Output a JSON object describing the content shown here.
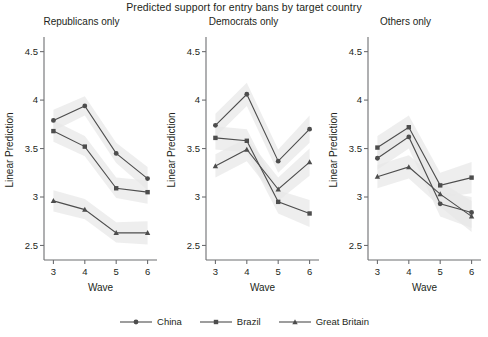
{
  "chart_data": {
    "type": "line",
    "title": "Predicted support for entry bans by target country",
    "xlabel": "Wave",
    "ylabel": "Linear Prediction",
    "x": [
      3,
      4,
      5,
      6
    ],
    "xticklabels": [
      "3",
      "4",
      "5",
      "6"
    ],
    "xlim": [
      2.7,
      6.3
    ],
    "ylim": [
      2.35,
      4.62
    ],
    "yticks": [
      2.5,
      3,
      3.5,
      4,
      4.5
    ],
    "yticklabels": [
      "2.5",
      "3",
      "3.5",
      "4",
      "4.5"
    ],
    "grid": false,
    "legend_position": "bottom",
    "legend_entries": [
      "China",
      "Brazil",
      "Great Britain"
    ],
    "markers": [
      "circle",
      "square",
      "triangle"
    ],
    "line_color": "#4d4d4d",
    "band_color": "#e8e8e8",
    "panels": [
      {
        "title": "Republicans only",
        "series": [
          {
            "name": "China",
            "marker": "circle",
            "values": [
              3.79,
              3.94,
              3.45,
              3.19
            ],
            "ci_lower": [
              3.68,
              3.84,
              3.35,
              3.07
            ],
            "ci_upper": [
              3.9,
              4.04,
              3.56,
              3.31
            ]
          },
          {
            "name": "Brazil",
            "marker": "square",
            "values": [
              3.68,
              3.52,
              3.09,
              3.05
            ],
            "ci_lower": [
              3.57,
              3.42,
              2.99,
              2.93
            ],
            "ci_upper": [
              3.79,
              3.63,
              3.2,
              3.17
            ]
          },
          {
            "name": "Great Britain",
            "marker": "triangle",
            "values": [
              2.96,
              2.87,
              2.63,
              2.63
            ],
            "ci_lower": [
              2.85,
              2.77,
              2.53,
              2.51
            ],
            "ci_upper": [
              3.07,
              2.98,
              2.74,
              2.75
            ]
          }
        ]
      },
      {
        "title": "Democrats only",
        "series": [
          {
            "name": "China",
            "marker": "circle",
            "values": [
              3.74,
              4.06,
              3.37,
              3.7
            ],
            "ci_lower": [
              3.62,
              3.94,
              3.25,
              3.56
            ],
            "ci_upper": [
              3.86,
              4.18,
              3.49,
              3.84
            ]
          },
          {
            "name": "Brazil",
            "marker": "square",
            "values": [
              3.61,
              3.58,
              2.95,
              2.83
            ],
            "ci_lower": [
              3.49,
              3.46,
              2.83,
              2.69
            ],
            "ci_upper": [
              3.73,
              3.7,
              3.07,
              2.97
            ]
          },
          {
            "name": "Great Britain",
            "marker": "triangle",
            "values": [
              3.32,
              3.49,
              3.08,
              3.36
            ],
            "ci_lower": [
              3.2,
              3.37,
              2.96,
              3.22
            ],
            "ci_upper": [
              3.44,
              3.61,
              3.2,
              3.5
            ]
          }
        ]
      },
      {
        "title": "Others only",
        "series": [
          {
            "name": "China",
            "marker": "circle",
            "values": [
              3.4,
              3.62,
              2.93,
              2.84
            ],
            "ci_lower": [
              3.28,
              3.5,
              2.8,
              2.68
            ],
            "ci_upper": [
              3.52,
              3.74,
              3.06,
              3.0
            ]
          },
          {
            "name": "Brazil",
            "marker": "square",
            "values": [
              3.51,
              3.72,
              3.12,
              3.2
            ],
            "ci_lower": [
              3.39,
              3.6,
              2.99,
              3.04
            ],
            "ci_upper": [
              3.63,
              3.84,
              3.25,
              3.36
            ]
          },
          {
            "name": "Great Britain",
            "marker": "triangle",
            "values": [
              3.21,
              3.31,
              3.03,
              2.8
            ],
            "ci_lower": [
              3.09,
              3.19,
              2.9,
              2.64
            ],
            "ci_upper": [
              3.33,
              3.43,
              3.16,
              2.96
            ]
          }
        ]
      }
    ]
  }
}
